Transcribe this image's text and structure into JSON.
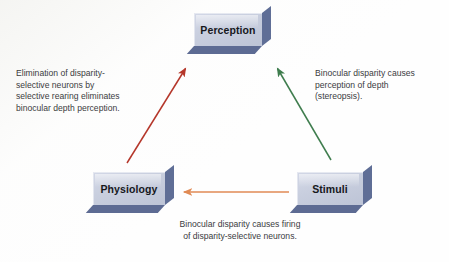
{
  "figure": {
    "type": "cycle-diagram",
    "background_color": "#fefefe",
    "nodes": [
      {
        "id": "perception",
        "label": "Perception",
        "position": "top-center"
      },
      {
        "id": "physiology",
        "label": "Physiology",
        "position": "bottom-left"
      },
      {
        "id": "stimuli",
        "label": "Stimuli",
        "position": "bottom-right"
      }
    ],
    "node_style": {
      "face_color": "#c8cede",
      "edge_color": "#5f6e96",
      "text_color": "#16181c"
    },
    "arrows": [
      {
        "id": "stimuli-to-perception",
        "from": "stimuli",
        "to": "perception",
        "color": "#3f7d4e",
        "label_id": "right"
      },
      {
        "id": "stimuli-to-physiology",
        "from": "stimuli",
        "to": "physiology",
        "color": "#e08a54",
        "label_id": "bottom"
      },
      {
        "id": "physiology-to-perception",
        "from": "physiology",
        "to": "perception",
        "color": "#b5372b",
        "label_id": "left"
      }
    ],
    "annotations": {
      "left": "Elimination of disparity-\nselective neurons by\nselective rearing eliminates\nbinocular depth perception.",
      "right": "Binocular disparity causes\nperception of depth\n(stereopsis).",
      "bottom": "Binocular disparity causes firing\nof disparity-selective neurons."
    }
  }
}
